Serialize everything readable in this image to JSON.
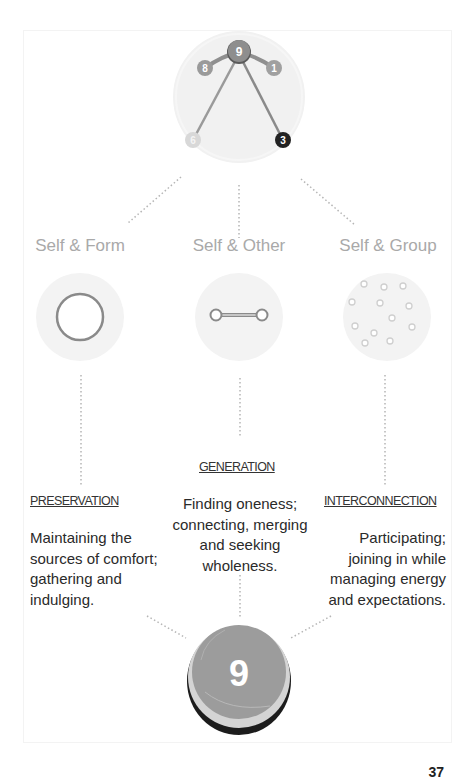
{
  "top_diagram": {
    "center_node": "9",
    "wing_left": "8",
    "wing_right": "1",
    "arrow_left": "6",
    "arrow_right": "3",
    "colors": {
      "node_9": "#8e8e8e",
      "node_8": "#9a9a9a",
      "node_1": "#a0a0a0",
      "node_6": "#d6d6d6",
      "node_3": "#222222",
      "background": "#f1f1f1"
    }
  },
  "categories": [
    {
      "label": "Self & Form",
      "icon": "ring-icon",
      "heading": "PRESERVATION",
      "description_lines": [
        "Maintaining the",
        "sources of comfort;",
        "gathering and",
        "indulging."
      ]
    },
    {
      "label": "Self & Other",
      "icon": "link-icon",
      "heading": "GENERATION",
      "description_lines": [
        "Finding oneness;",
        "connecting, merging",
        "and seeking",
        "wholeness."
      ]
    },
    {
      "label": "Self & Group",
      "icon": "dots-cluster-icon",
      "heading": "INTERCONNECTION",
      "description_lines": [
        "Participating;",
        "joining in while",
        "managing energy",
        "and expectations."
      ]
    }
  ],
  "bottom_badge": {
    "number": "9",
    "color": "#9c9c9c"
  },
  "page_number": "37"
}
